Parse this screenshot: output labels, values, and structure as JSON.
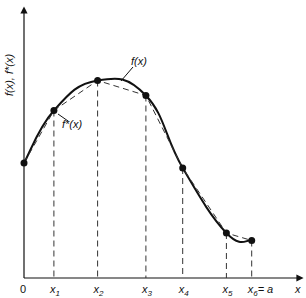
{
  "figure": {
    "y_axis_label": "f(x), f*(x)",
    "x_axis_label": "x",
    "origin_label": "0",
    "curve_label": "f(x)",
    "approx_label": "f*(x)",
    "ticks": [
      {
        "base": "x",
        "sub": "1",
        "suffix": ""
      },
      {
        "base": "x",
        "sub": "2",
        "suffix": ""
      },
      {
        "base": "x",
        "sub": "3",
        "suffix": ""
      },
      {
        "base": "x",
        "sub": "4",
        "suffix": ""
      },
      {
        "base": "x",
        "sub": "5",
        "suffix": ""
      },
      {
        "base": "x",
        "sub": "6",
        "suffix": "= a"
      }
    ]
  },
  "chart_data": {
    "type": "line",
    "title": "",
    "xlabel": "x",
    "ylabel": "f(x), f*(x)",
    "series": [
      {
        "name": "f(x)",
        "style": "solid-smooth"
      },
      {
        "name": "f*(x)",
        "style": "dashed-piecewise-linear"
      }
    ],
    "nodes": [
      {
        "x": 0.0,
        "y": 0.46
      },
      {
        "x": 0.13,
        "y": 0.67
      },
      {
        "x": 0.32,
        "y": 0.79
      },
      {
        "x": 0.53,
        "y": 0.73
      },
      {
        "x": 0.69,
        "y": 0.44
      },
      {
        "x": 0.88,
        "y": 0.18
      },
      {
        "x": 0.99,
        "y": 0.15
      }
    ],
    "xlim": [
      0,
      1.1
    ],
    "ylim": [
      0,
      1.1
    ],
    "grid": false
  }
}
